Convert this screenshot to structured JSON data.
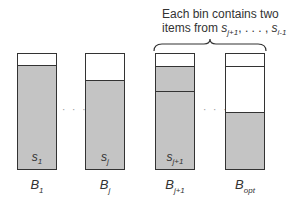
{
  "caption": {
    "line1": "Each bin contains two",
    "line2_prefix": "items from ",
    "seq_start": "s",
    "seq_start_sub": "j+1",
    "seq_mid": ", . . . , ",
    "seq_end": "s",
    "seq_end_sub": "i-1",
    "seq_suffix": "."
  },
  "separator": "· · ·",
  "bins": [
    {
      "label": "B",
      "label_sub": "1",
      "item": "s",
      "item_sub": "1"
    },
    {
      "label": "B",
      "label_sub": "j",
      "item": "s",
      "item_sub": "j"
    },
    {
      "label": "B",
      "label_sub": "j+1",
      "item": "s",
      "item_sub": "j+1"
    },
    {
      "label": "B",
      "label_sub": "opt",
      "item": "",
      "item_sub": ""
    }
  ],
  "colors": {
    "fill": "#c4c4c4",
    "stroke": "#333333",
    "empty": "#ffffff"
  }
}
